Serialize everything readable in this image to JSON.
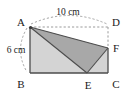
{
  "figure": {
    "type": "geometry-diagram",
    "colors": {
      "outline": "#4d4d4d",
      "dashed": "#9a9a9a",
      "rect_fill": "#d4d4d4",
      "triangle_fill": "#a8a8a8",
      "label_color": "#1a1a1a",
      "background": "#ffffff"
    },
    "vertices": [
      {
        "name": "A",
        "label": "A",
        "x": 30,
        "y": 27,
        "label_x": 21,
        "label_y": 26
      },
      {
        "name": "B",
        "label": "B",
        "x": 30,
        "y": 73,
        "label_x": 21,
        "label_y": 88
      },
      {
        "name": "C",
        "label": "C",
        "x": 108,
        "y": 73,
        "label_x": 112,
        "label_y": 88
      },
      {
        "name": "D",
        "label": "D",
        "x": 108,
        "y": 27,
        "label_x": 112,
        "label_y": 26
      },
      {
        "name": "E",
        "label": "E",
        "x": 87,
        "y": 73,
        "label_x": 84,
        "label_y": 90
      },
      {
        "name": "F",
        "label": "F",
        "x": 108,
        "y": 48,
        "label_x": 112,
        "label_y": 51
      }
    ],
    "dimensions": [
      {
        "name": "top-width",
        "label": "10 cm",
        "value": 10,
        "unit": "cm",
        "label_x": 68,
        "label_y": 15
      },
      {
        "name": "left-height",
        "label": "6 cm",
        "value": 6,
        "unit": "cm",
        "label_x": 16,
        "label_y": 53
      }
    ],
    "shapes": {
      "rectangle_points": "30,27 108,27 108,73 30,73",
      "filled_region_points": "30,27 108,48 108,73 30,73",
      "shaded_triangle_points": "30,27 108,48 87,73"
    },
    "solid_edges": [
      {
        "name": "edge-AB",
        "x1": 30,
        "y1": 27,
        "x2": 30,
        "y2": 73
      },
      {
        "name": "edge-BC",
        "x1": 30,
        "y1": 73,
        "x2": 108,
        "y2": 73
      },
      {
        "name": "edge-CF",
        "x1": 108,
        "y1": 73,
        "x2": 108,
        "y2": 48
      },
      {
        "name": "edge-AF",
        "x1": 30,
        "y1": 27,
        "x2": 108,
        "y2": 48
      },
      {
        "name": "edge-AE",
        "x1": 30,
        "y1": 27,
        "x2": 87,
        "y2": 73
      },
      {
        "name": "edge-EF",
        "x1": 87,
        "y1": 73,
        "x2": 108,
        "y2": 48
      }
    ],
    "dashed_edges": [
      {
        "name": "edge-AD",
        "x1": 30,
        "y1": 27,
        "x2": 108,
        "y2": 27
      },
      {
        "name": "edge-DF",
        "x1": 108,
        "y1": 27,
        "x2": 108,
        "y2": 48
      }
    ],
    "dimension_arcs": [
      {
        "name": "arc-top-10cm",
        "d": "M 31 24 Q 69 7 107 24"
      },
      {
        "name": "arc-left-6cm",
        "d": "M 27 28 Q 14 50 27 72"
      }
    ]
  }
}
